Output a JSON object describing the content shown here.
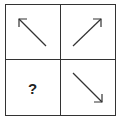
{
  "puzzle": {
    "layout": "2x2 grid",
    "cells": [
      {
        "position": "top-left",
        "content": "arrow",
        "direction": "up-left"
      },
      {
        "position": "top-right",
        "content": "arrow",
        "direction": "up-right"
      },
      {
        "position": "bottom-left",
        "content": "question-mark",
        "label": "?"
      },
      {
        "position": "bottom-right",
        "content": "arrow",
        "direction": "down-right"
      }
    ],
    "line_color": "#333333",
    "background": "#ffffff"
  }
}
